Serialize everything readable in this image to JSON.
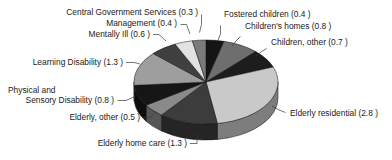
{
  "chart_data": {
    "type": "pie",
    "title": "",
    "subtitle": "",
    "xlabel": "",
    "ylabel": "",
    "legend_position": "none",
    "grid": false,
    "three_d": true,
    "start_angle_deg": 0,
    "direction": "clockwise",
    "total": 11.4,
    "value_suffix": "",
    "categories": [
      "Fostered children",
      "Children's homes",
      "Children, other",
      "Elderly residential",
      "Elderly home care",
      "Elderly, other",
      "Physical and Sensory Disability",
      "Learning Disability",
      "Mentally Ill",
      "Management",
      "Central Government Services"
    ],
    "values": [
      0.4,
      0.8,
      0.7,
      2.8,
      1.3,
      0.5,
      0.8,
      1.3,
      0.6,
      0.4,
      0.3
    ],
    "colors": [
      "#151515",
      "#6e6e6e",
      "#1d1d1d",
      "#c9c9c9",
      "#3c3c3c",
      "#8a8a8a",
      "#161616",
      "#9e9e9e",
      "#404040",
      "#e2e2e2",
      "#7a7a7a"
    ],
    "slices": [
      {
        "label": "Fostered children (0.4 )",
        "value": 0.4,
        "color": "#151515"
      },
      {
        "label": "Children's homes (0.8 )",
        "value": 0.8,
        "color": "#6e6e6e"
      },
      {
        "label": "Children, other (0.7 )",
        "value": 0.7,
        "color": "#1d1d1d"
      },
      {
        "label": "Elderly residential (2.8 )",
        "value": 2.8,
        "color": "#c9c9c9"
      },
      {
        "label": "Elderly home care (1.3 )",
        "value": 1.3,
        "color": "#3c3c3c"
      },
      {
        "label": "Elderly, other (0.5 )",
        "value": 0.5,
        "color": "#8a8a8a"
      },
      {
        "label": "Physical and Sensory Disability (0.8 )",
        "value": 0.8,
        "color": "#161616"
      },
      {
        "label": "Learning Disability (1.3 )",
        "value": 1.3,
        "color": "#9e9e9e"
      },
      {
        "label": "Mentally Ill (0.6 )",
        "value": 0.6,
        "color": "#404040"
      },
      {
        "label": "Management (0.4 )",
        "value": 0.4,
        "color": "#e2e2e2"
      },
      {
        "label": "Central Government Services (0.3 )",
        "value": 0.3,
        "color": "#7a7a7a"
      }
    ]
  },
  "labels": {
    "central_government_services": "Central Government Services (0.3 )",
    "management": "Management (0.4 )",
    "mentally_ill": "Mentally Ill (0.6 )",
    "learning_disability": "Learning Disability (1.3 )",
    "physical_sensory_line1": "Physical and",
    "physical_sensory_line2": "Sensory Disability (0.8 )",
    "elderly_other": "Elderly, other (0.5 )",
    "elderly_home_care": "Elderly home care (1.3 )",
    "fostered_children": "Fostered children (0.4 )",
    "childrens_homes": "Children's homes (0.8 )",
    "children_other": "Children, other (0.7 )",
    "elderly_residential": "Elderly residential (2.8 )"
  }
}
